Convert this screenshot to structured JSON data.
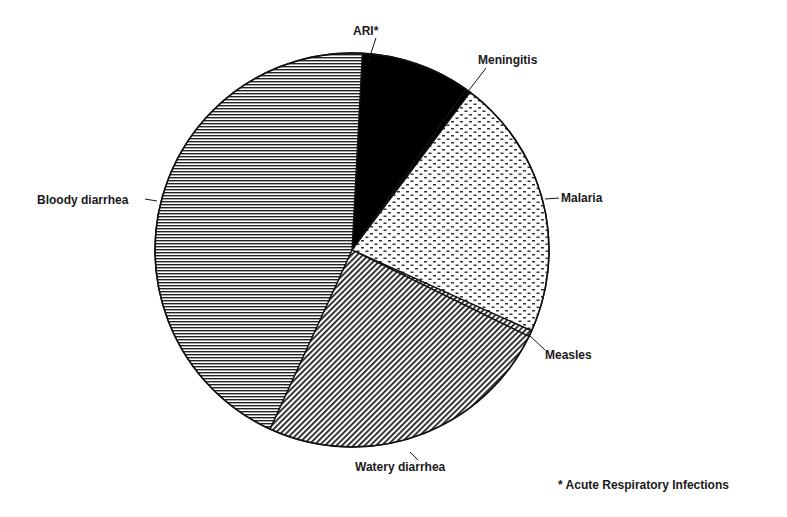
{
  "chart_data": {
    "type": "pie",
    "title": "",
    "start_angle_deg": 3,
    "direction": "clockwise",
    "slices": [
      {
        "label": "ARI*",
        "value": 9.0,
        "pattern": "solid",
        "color": "#000000"
      },
      {
        "label": "Meningitis",
        "value": 0.4,
        "pattern": "solid",
        "color": "#000000"
      },
      {
        "label": "Malaria",
        "value": 21.5,
        "pattern": "dots",
        "color": "#ffffff"
      },
      {
        "label": "Measles",
        "value": 0.5,
        "pattern": "diagonal",
        "color": "#ffffff"
      },
      {
        "label": "Watery diarrhea",
        "value": 24.6,
        "pattern": "diagonal",
        "color": "#ffffff"
      },
      {
        "label": "Bloody diarrhea",
        "value": 44.0,
        "pattern": "horizontal",
        "color": "#ffffff"
      }
    ],
    "footnote": "* Acute Respiratory Infections",
    "legend": "none (callout labels)"
  },
  "labels": {
    "ari": "ARI*",
    "meningitis": "Meningitis",
    "malaria": "Malaria",
    "measles": "Measles",
    "watery": "Watery diarrhea",
    "bloody": "Bloody diarrhea"
  },
  "footnote": "* Acute Respiratory Infections"
}
